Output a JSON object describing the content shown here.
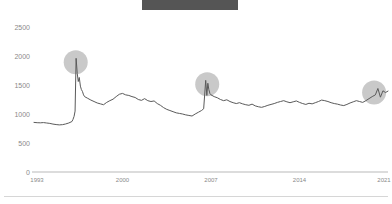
{
  "title_bar": {
    "label": "",
    "redacted": true,
    "color": "#555555"
  },
  "chart_data": {
    "type": "line",
    "title": "",
    "subtitle": "",
    "xlabel": "",
    "ylabel": "",
    "grid": false,
    "legend": "none",
    "xlim": [
      1993,
      2021
    ],
    "ylim": [
      0,
      2500
    ],
    "y_ticks": [
      0,
      500,
      1000,
      1500,
      2000,
      2500
    ],
    "y_tick_labels": [
      "0",
      "500",
      "1000",
      "1500",
      "2000",
      "2500"
    ],
    "x_ticks": [
      1993,
      2000,
      2007,
      2014,
      2021
    ],
    "x_tick_labels": [
      "1993",
      "2000",
      "2007",
      "2014",
      "2021"
    ],
    "line_color": "#5a5a5a",
    "highlight_color": "#c9c9c9",
    "annotations": [
      {
        "name": "peak-1996",
        "x": 1996.3,
        "y": 1960,
        "radius": 12
      },
      {
        "name": "peak-2006",
        "x": 2006.7,
        "y": 1580,
        "radius": 12
      },
      {
        "name": "peak-2020",
        "x": 2019.9,
        "y": 1440,
        "radius": 12
      }
    ],
    "series": [
      {
        "name": "value",
        "x": [
          1993.0,
          1993.25,
          1993.5,
          1993.75,
          1994.0,
          1994.25,
          1994.5,
          1994.75,
          1995.0,
          1995.25,
          1995.5,
          1995.75,
          1996.0,
          1996.08,
          1996.17,
          1996.25,
          1996.33,
          1996.42,
          1996.5,
          1996.58,
          1996.67,
          1996.75,
          1996.83,
          1996.92,
          1997.0,
          1997.25,
          1997.5,
          1997.75,
          1998.0,
          1998.25,
          1998.5,
          1998.75,
          1999.0,
          1999.25,
          1999.5,
          1999.75,
          2000.0,
          2000.25,
          2000.5,
          2000.75,
          2001.0,
          2001.25,
          2001.5,
          2001.75,
          2002.0,
          2002.25,
          2002.5,
          2002.75,
          2003.0,
          2003.25,
          2003.5,
          2003.75,
          2004.0,
          2004.25,
          2004.5,
          2004.75,
          2005.0,
          2005.25,
          2005.5,
          2005.75,
          2006.0,
          2006.25,
          2006.42,
          2006.58,
          2006.67,
          2006.75,
          2006.83,
          2006.92,
          2007.0,
          2007.25,
          2007.5,
          2007.75,
          2008.0,
          2008.25,
          2008.5,
          2008.75,
          2009.0,
          2009.25,
          2009.5,
          2009.75,
          2010.0,
          2010.25,
          2010.5,
          2010.75,
          2011.0,
          2011.25,
          2011.5,
          2011.75,
          2012.0,
          2012.25,
          2012.5,
          2012.75,
          2013.0,
          2013.25,
          2013.5,
          2013.75,
          2014.0,
          2014.25,
          2014.5,
          2014.75,
          2015.0,
          2015.25,
          2015.5,
          2015.75,
          2016.0,
          2016.25,
          2016.5,
          2016.75,
          2017.0,
          2017.25,
          2017.5,
          2017.75,
          2018.0,
          2018.25,
          2018.5,
          2018.75,
          2019.0,
          2019.25,
          2019.5,
          2019.75,
          2020.0,
          2020.2,
          2020.4,
          2020.6,
          2020.8,
          2021.0
        ],
        "values": [
          855,
          850,
          848,
          852,
          845,
          838,
          826,
          818,
          812,
          816,
          828,
          845,
          870,
          905,
          960,
          1050,
          1960,
          1700,
          1560,
          1630,
          1480,
          1420,
          1390,
          1330,
          1300,
          1270,
          1240,
          1215,
          1190,
          1175,
          1160,
          1200,
          1230,
          1255,
          1300,
          1340,
          1355,
          1330,
          1320,
          1300,
          1285,
          1250,
          1235,
          1265,
          1230,
          1215,
          1225,
          1180,
          1150,
          1110,
          1080,
          1060,
          1040,
          1020,
          1010,
          1000,
          985,
          975,
          965,
          1000,
          1030,
          1060,
          1090,
          1580,
          1320,
          1530,
          1420,
          1350,
          1330,
          1300,
          1280,
          1250,
          1230,
          1245,
          1215,
          1195,
          1180,
          1195,
          1175,
          1160,
          1150,
          1170,
          1140,
          1125,
          1115,
          1130,
          1150,
          1165,
          1180,
          1200,
          1215,
          1230,
          1210,
          1195,
          1210,
          1225,
          1200,
          1180,
          1165,
          1185,
          1175,
          1195,
          1215,
          1240,
          1230,
          1215,
          1195,
          1180,
          1170,
          1155,
          1145,
          1165,
          1190,
          1210,
          1230,
          1215,
          1200,
          1230,
          1265,
          1300,
          1330,
          1440,
          1290,
          1400,
          1370,
          1395
        ]
      }
    ]
  },
  "footer": {
    "divider": true
  }
}
